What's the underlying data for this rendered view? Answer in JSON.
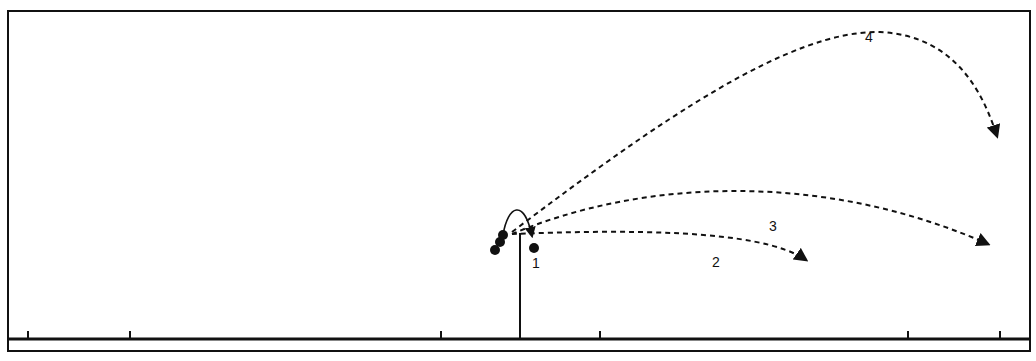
{
  "diagram": {
    "type": "trajectory-diagram",
    "colors": {
      "stroke": "#111111",
      "background": "#ffffff"
    },
    "frame": {
      "x": 8,
      "y": 11,
      "width": 1022,
      "height": 340
    },
    "ground": {
      "y": 339,
      "x1": 8,
      "x2": 1030
    },
    "ground_ticks_x": [
      28,
      130,
      441,
      600,
      908,
      1000
    ],
    "pole": {
      "x": 520,
      "top_y": 233,
      "bottom_y": 339
    },
    "balls": [
      {
        "cx": 495,
        "cy": 250,
        "r": 5
      },
      {
        "cx": 500,
        "cy": 242,
        "r": 5
      },
      {
        "cx": 503,
        "cy": 235,
        "r": 5
      },
      {
        "cx": 534,
        "cy": 248,
        "r": 5
      }
    ],
    "trajectories": [
      {
        "id": "1",
        "label": "1",
        "style": "solid",
        "path": "M 503 235 C 508 205, 524 198, 532 236",
        "label_pos": [
          536,
          268
        ]
      },
      {
        "id": "2",
        "label": "2",
        "style": "dashed",
        "path": "M 512 234 C 620 230, 760 228, 806 260",
        "label_pos": [
          716,
          267
        ]
      },
      {
        "id": "3",
        "label": "3",
        "style": "dashed",
        "path": "M 512 234 C 640 180, 820 170, 988 244",
        "label_pos": [
          773,
          231
        ]
      },
      {
        "id": "4",
        "label": "4",
        "style": "dashed",
        "path": "M 512 232 C 660 120, 790 30, 880 32 C 960 36, 985 100, 997 136",
        "label_pos": [
          869,
          42
        ]
      }
    ],
    "labels": [
      "1",
      "2",
      "3",
      "4"
    ]
  }
}
